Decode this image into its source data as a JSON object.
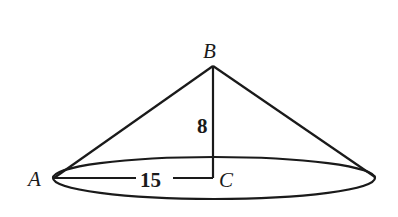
{
  "diagram": {
    "type": "cone",
    "colors": {
      "stroke": "#1a1a1a",
      "background": "#ffffff"
    },
    "points": {
      "A": {
        "label": "A",
        "x": 54,
        "y": 178
      },
      "B": {
        "label": "B",
        "x": 213,
        "y": 66
      },
      "C": {
        "label": "C",
        "x": 213,
        "y": 178
      },
      "D": {
        "x": 375,
        "y": 177
      }
    },
    "base_ellipse": {
      "cx": 214,
      "cy": 178,
      "rx": 161,
      "ry": 21
    },
    "measurements": {
      "height": {
        "label": "8",
        "segment": "BC"
      },
      "radius": {
        "label": "15",
        "segment": "AC"
      }
    }
  }
}
